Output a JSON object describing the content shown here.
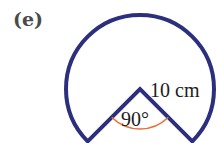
{
  "figure": {
    "part_label": "(e)",
    "radius_label": "10 cm",
    "angle_label": "90°",
    "colors": {
      "outline": "#2b2f7e",
      "angle_arc": "#e8703a",
      "text": "#1c1c1c",
      "part_label": "#4a4a4a"
    }
  }
}
